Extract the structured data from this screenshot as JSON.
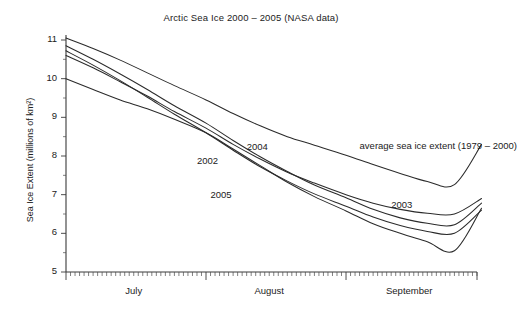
{
  "chart_data": {
    "type": "line",
    "title": "Arctic Sea Ice 2000 – 2005 (NASA data)",
    "xlabel": "",
    "ylabel": "Sea Ice Extent (millions of km²)",
    "ylim": [
      5,
      11.3
    ],
    "yticks": [
      5,
      6,
      7,
      8,
      9,
      10,
      11
    ],
    "ytick_labels": [
      "5",
      "6",
      "7",
      "8",
      "9",
      "10",
      "11"
    ],
    "yminor_step": 0.5,
    "grid": false,
    "legend_position": "inline-annotations",
    "x_axis_type": "day-of-year",
    "xlim_days": [
      182,
      273
    ],
    "xtick_labels": [
      "July",
      "August",
      "September"
    ],
    "xtick_label_days": [
      197,
      227,
      258
    ],
    "xminor_tick": "daily",
    "xmajor_tick_days": [
      182,
      213,
      244,
      274
    ],
    "annotations": [
      {
        "text": "2004",
        "x_day": 222,
        "y_value": 8.22
      },
      {
        "text": "2002",
        "x_day": 211,
        "y_value": 7.88
      },
      {
        "text": "2005",
        "x_day": 214,
        "y_value": 6.98
      },
      {
        "text": "2003",
        "x_day": 254,
        "y_value": 6.72
      },
      {
        "text": "average sea ice extent (1979 – 2000)",
        "x_day": 247,
        "y_value": 8.25
      }
    ],
    "series": [
      {
        "name": "average sea ice extent (1979 – 2000)",
        "color": "#2b2b2b",
        "x_days": [
          182,
          188,
          194,
          200,
          206,
          213,
          219,
          225,
          231,
          237,
          244,
          250,
          256,
          262,
          268,
          274
        ],
        "values": [
          11.05,
          10.78,
          10.48,
          10.15,
          9.82,
          9.45,
          9.1,
          8.78,
          8.5,
          8.28,
          8.02,
          7.78,
          7.55,
          7.34,
          7.26,
          8.3
        ]
      },
      {
        "name": "2004",
        "color": "#2b2b2b",
        "x_days": [
          182,
          188,
          194,
          200,
          206,
          213,
          219,
          225,
          231,
          237,
          244,
          250,
          256,
          262,
          268,
          274
        ],
        "values": [
          10.85,
          10.5,
          10.12,
          9.72,
          9.3,
          8.85,
          8.4,
          7.98,
          7.6,
          7.25,
          6.92,
          6.62,
          6.4,
          6.26,
          6.22,
          6.78
        ]
      },
      {
        "name": "2002",
        "color": "#5a5a5a",
        "x_days": [
          182,
          188,
          194,
          200,
          206,
          213,
          219,
          225,
          231,
          237,
          244,
          250,
          256,
          262,
          268,
          274
        ],
        "values": [
          10.72,
          10.35,
          9.95,
          9.52,
          9.08,
          8.6,
          8.15,
          7.72,
          7.35,
          7.02,
          6.7,
          6.42,
          6.2,
          6.05,
          6.0,
          6.6
        ]
      },
      {
        "name": "2003",
        "color": "#5a5a5a",
        "x_days": [
          182,
          188,
          194,
          200,
          206,
          213,
          219,
          225,
          231,
          237,
          244,
          250,
          256,
          262,
          268,
          274
        ],
        "values": [
          10.6,
          10.28,
          9.92,
          9.55,
          9.15,
          8.72,
          8.3,
          7.92,
          7.58,
          7.3,
          7.0,
          6.78,
          6.62,
          6.52,
          6.5,
          6.9
        ]
      },
      {
        "name": "2005",
        "color": "#2b2b2b",
        "x_days": [
          182,
          188,
          194,
          200,
          206,
          213,
          219,
          225,
          231,
          237,
          244,
          250,
          256,
          262,
          268,
          274
        ],
        "values": [
          10.0,
          9.72,
          9.45,
          9.22,
          8.95,
          8.6,
          8.18,
          7.75,
          7.32,
          6.95,
          6.58,
          6.25,
          6.0,
          5.78,
          5.55,
          6.65
        ]
      }
    ]
  },
  "axes": {
    "y_title": "Sea Ice Extent (millions of km²)"
  }
}
